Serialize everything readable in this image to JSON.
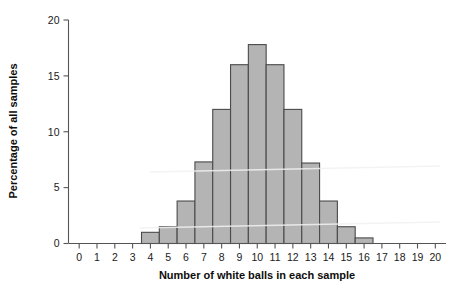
{
  "chart_data": {
    "type": "bar",
    "title": "",
    "subtitle": "",
    "xlabel": "Number of white balls in each sample",
    "ylabel": "Percentage of all samples",
    "categories": [
      0,
      1,
      2,
      3,
      4,
      5,
      6,
      7,
      8,
      9,
      10,
      11,
      12,
      13,
      14,
      15,
      16,
      17,
      18,
      19,
      20
    ],
    "values": [
      0,
      0,
      0,
      0,
      1.0,
      1.5,
      3.8,
      7.3,
      12.0,
      16.0,
      17.8,
      16.0,
      12.0,
      7.2,
      3.8,
      1.5,
      0.5,
      0,
      0,
      0,
      0
    ],
    "xtick_labels": [
      "0",
      "1",
      "2",
      "3",
      "4",
      "5",
      "6",
      "7",
      "8",
      "9",
      "10",
      "11",
      "12",
      "13",
      "14",
      "15",
      "16",
      "17",
      "18",
      "19",
      "20"
    ],
    "ytick_labels": [
      "0",
      "5",
      "10",
      "15",
      "20"
    ],
    "yticks": [
      0,
      5,
      10,
      15,
      20
    ],
    "xlim": [
      -0.6,
      20.6
    ],
    "ylim": [
      0,
      20
    ],
    "grid": false,
    "legend": null,
    "bar_width": 1.0,
    "bar_fill_color": "#b4b4b4",
    "bar_edge_color": "#4a4a4a",
    "axis_color": "#555555",
    "background_color": "#ffffff"
  }
}
